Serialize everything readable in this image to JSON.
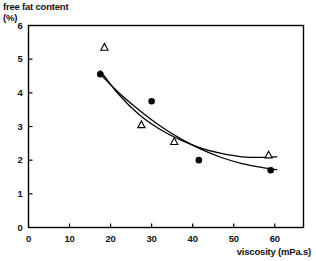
{
  "chart_data": {
    "type": "scatter",
    "title": "",
    "subtitle": "",
    "xlabel": "viscosity (mPa.s)",
    "ylabel": "free fat content (%)",
    "ylabel_line1": "free fat content",
    "ylabel_line2": "(%)",
    "xlim": [
      0,
      67
    ],
    "ylim": [
      0,
      6
    ],
    "xticks": [
      0,
      10,
      20,
      30,
      40,
      50,
      60
    ],
    "xtick_labels": [
      "0",
      "10",
      "20",
      "30",
      "40",
      "50",
      "60"
    ],
    "yticks": [
      0,
      1,
      2,
      3,
      4,
      5,
      6
    ],
    "ytick_labels": [
      "0",
      "1",
      "2",
      "3",
      "4",
      "5",
      "6"
    ],
    "grid": false,
    "legend": "none",
    "frame": "box",
    "series": [
      {
        "name": "filled-circle-series",
        "marker": "filled-circle",
        "color": "#000000",
        "points": [
          {
            "x": 17.5,
            "y": 4.55
          },
          {
            "x": 30.0,
            "y": 3.75
          },
          {
            "x": 41.5,
            "y": 2.0
          },
          {
            "x": 59.0,
            "y": 1.7
          }
        ],
        "fit_curve": [
          {
            "x": 17.0,
            "y": 4.62
          },
          {
            "x": 22.0,
            "y": 4.0
          },
          {
            "x": 27.0,
            "y": 3.48
          },
          {
            "x": 32.0,
            "y": 3.02
          },
          {
            "x": 37.0,
            "y": 2.64
          },
          {
            "x": 42.0,
            "y": 2.33
          },
          {
            "x": 47.0,
            "y": 2.08
          },
          {
            "x": 52.0,
            "y": 1.9
          },
          {
            "x": 57.0,
            "y": 1.78
          },
          {
            "x": 60.5,
            "y": 1.72
          }
        ]
      },
      {
        "name": "open-triangle-series",
        "marker": "open-triangle",
        "color": "#000000",
        "points": [
          {
            "x": 18.5,
            "y": 5.35
          },
          {
            "x": 27.5,
            "y": 3.05
          },
          {
            "x": 35.5,
            "y": 2.55
          },
          {
            "x": 58.5,
            "y": 2.15
          }
        ],
        "fit_curve": [
          {
            "x": 17.5,
            "y": 4.66
          },
          {
            "x": 22.0,
            "y": 3.95
          },
          {
            "x": 27.0,
            "y": 3.35
          },
          {
            "x": 32.0,
            "y": 2.92
          },
          {
            "x": 37.0,
            "y": 2.6
          },
          {
            "x": 42.0,
            "y": 2.36
          },
          {
            "x": 47.0,
            "y": 2.2
          },
          {
            "x": 52.0,
            "y": 2.1
          },
          {
            "x": 57.0,
            "y": 2.08
          },
          {
            "x": 60.5,
            "y": 2.1
          }
        ]
      }
    ]
  }
}
